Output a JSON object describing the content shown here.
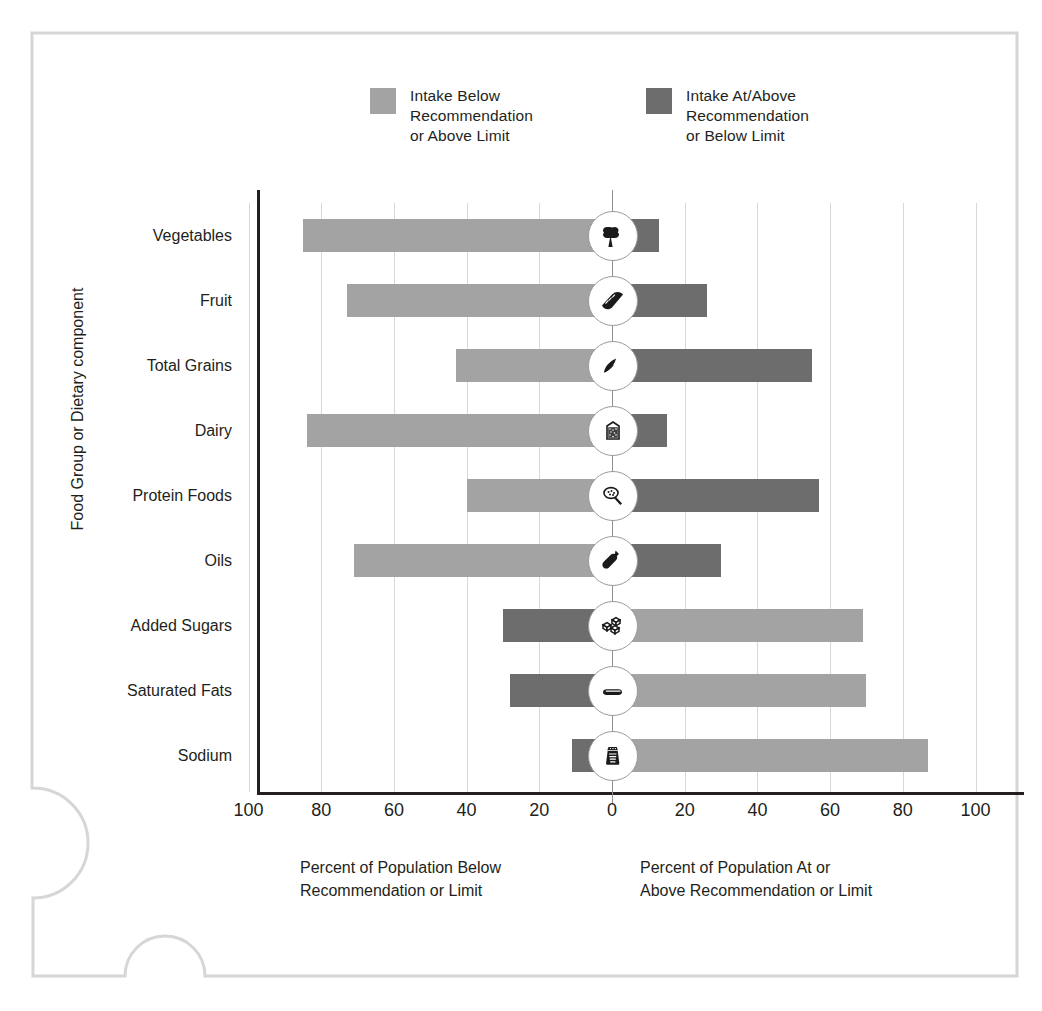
{
  "chart_data": {
    "type": "bar",
    "title": "",
    "subtitle": "",
    "orientation": "horizontal-diverging",
    "xlabel_left": "Percent of Population  Below\nRecommendation  or Limit",
    "xlabel_right": "Percent of Population At or\nAbove Recommendation or Limit",
    "ylabel": "Food Group or Dietary component",
    "xlim": [
      -100,
      100
    ],
    "xticks": [
      100,
      80,
      60,
      40,
      20,
      0,
      20,
      40,
      60,
      80,
      100
    ],
    "xtick_values": [
      -100,
      -80,
      -60,
      -40,
      -20,
      0,
      20,
      40,
      60,
      80,
      100
    ],
    "grid": true,
    "legend_position": "top",
    "legend": [
      {
        "label": "Intake Below\nRecommendation\nor Above Limit",
        "color": "#a3a3a3",
        "key": "below-recommendation-or-above-limit"
      },
      {
        "label": "Intake At/Above\nRecommendation\nor Below Limit",
        "color": "#6d6d6d",
        "key": "at-above-recommendation-or-below-limit"
      }
    ],
    "categories": [
      "Vegetables",
      "Fruit",
      "Total Grains",
      "Dairy",
      "Protein Foods",
      "Oils",
      "Added Sugars",
      "Saturated Fats",
      "Sodium"
    ],
    "series": [
      {
        "name": "Intake Below Recommendation or Above Limit",
        "color": "#a3a3a3",
        "values": [
          85,
          73,
          43,
          84,
          40,
          71,
          69,
          70,
          87
        ]
      },
      {
        "name": "Intake At/Above Recommendation or Below Limit",
        "color": "#6d6d6d",
        "values": [
          13,
          26,
          55,
          15,
          57,
          30,
          30,
          28,
          11
        ]
      }
    ],
    "rows": [
      {
        "category": "Vegetables",
        "icon": "broccoli-icon",
        "left_value": 85,
        "left_color": "#a3a3a3",
        "right_value": 13,
        "right_color": "#6d6d6d"
      },
      {
        "category": "Fruit",
        "icon": "orange-slice-icon",
        "left_value": 73,
        "left_color": "#a3a3a3",
        "right_value": 26,
        "right_color": "#6d6d6d"
      },
      {
        "category": "Total Grains",
        "icon": "grain-bread-icon",
        "left_value": 43,
        "left_color": "#a3a3a3",
        "right_value": 55,
        "right_color": "#6d6d6d"
      },
      {
        "category": "Dairy",
        "icon": "milk-carton-icon",
        "left_value": 84,
        "left_color": "#a3a3a3",
        "right_value": 15,
        "right_color": "#6d6d6d"
      },
      {
        "category": "Protein Foods",
        "icon": "protein-meat-icon",
        "left_value": 40,
        "left_color": "#a3a3a3",
        "right_value": 57,
        "right_color": "#6d6d6d"
      },
      {
        "category": "Oils",
        "icon": "oil-bottle-icon",
        "left_value": 71,
        "left_color": "#a3a3a3",
        "right_value": 30,
        "right_color": "#6d6d6d"
      },
      {
        "category": "Added Sugars",
        "icon": "sugar-cubes-icon",
        "left_value": 30,
        "left_color": "#6d6d6d",
        "right_value": 69,
        "right_color": "#a3a3a3"
      },
      {
        "category": "Saturated Fats",
        "icon": "butter-stick-icon",
        "left_value": 28,
        "left_color": "#6d6d6d",
        "right_value": 70,
        "right_color": "#a3a3a3"
      },
      {
        "category": "Sodium",
        "icon": "salt-shaker-icon",
        "left_value": 11,
        "left_color": "#6d6d6d",
        "right_value": 87,
        "right_color": "#a3a3a3"
      }
    ]
  },
  "colors": {
    "light_gray_bar": "#a3a3a3",
    "dark_gray_bar": "#6d6d6d",
    "gridline": "#d8d8d8",
    "axis": "#231f20",
    "frame": "#d6d6d6",
    "background": "#ffffff"
  }
}
